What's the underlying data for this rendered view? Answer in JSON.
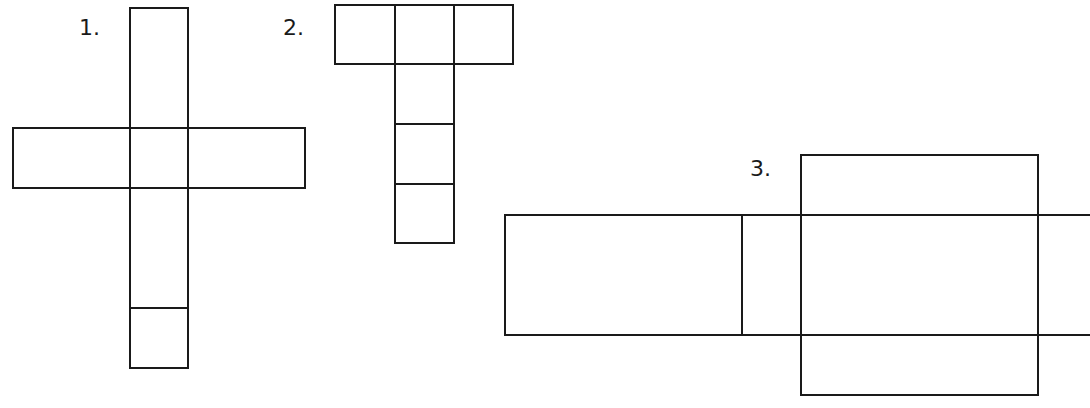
{
  "figures": [
    {
      "label": "1.",
      "description": "cross-shaped net: vertical strip of 4 cells with wide side flaps",
      "label_pos": [
        79,
        17
      ],
      "lines": [
        [
          130,
          8,
          188,
          8
        ],
        [
          130,
          8,
          130,
          368
        ],
        [
          188,
          8,
          188,
          128
        ],
        [
          188,
          188,
          188,
          368
        ],
        [
          130,
          368,
          188,
          368
        ],
        [
          13,
          128,
          305,
          128
        ],
        [
          13,
          188,
          305,
          188
        ],
        [
          13,
          128,
          13,
          188
        ],
        [
          305,
          128,
          305,
          188
        ],
        [
          130,
          128,
          130,
          188
        ],
        [
          188,
          128,
          188,
          188
        ],
        [
          130,
          308,
          188,
          308
        ]
      ]
    },
    {
      "label": "2.",
      "description": "T-shaped net: row of 3 cells on top, column of 3 cells below center",
      "label_pos": [
        283,
        17
      ],
      "lines": [
        [
          335,
          5,
          513,
          5
        ],
        [
          335,
          64,
          513,
          64
        ],
        [
          335,
          5,
          335,
          64
        ],
        [
          513,
          5,
          513,
          64
        ],
        [
          395,
          5,
          395,
          243
        ],
        [
          454,
          5,
          454,
          243
        ],
        [
          395,
          124,
          454,
          124
        ],
        [
          395,
          184,
          454,
          184
        ],
        [
          395,
          243,
          454,
          243
        ]
      ]
    },
    {
      "label": "3.",
      "description": "cuboid net: long horizontal strip crossed by a tall rectangle",
      "label_pos": [
        750,
        158
      ],
      "lines": [
        [
          505,
          215,
          1090,
          215
        ],
        [
          505,
          335,
          1090,
          335
        ],
        [
          505,
          215,
          505,
          335
        ],
        [
          742,
          215,
          742,
          335
        ],
        [
          801,
          155,
          1038,
          155
        ],
        [
          801,
          395,
          1038,
          395
        ],
        [
          801,
          155,
          801,
          395
        ],
        [
          1038,
          155,
          1038,
          395
        ]
      ]
    }
  ],
  "colors": {
    "stroke": "#1a1a1a",
    "background": "#ffffff"
  }
}
